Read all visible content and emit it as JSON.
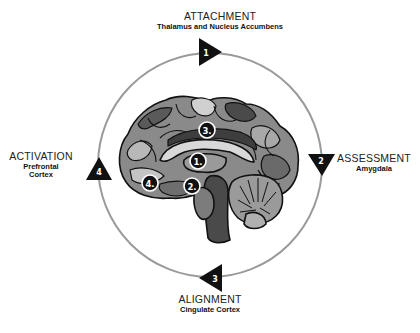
{
  "diagram": {
    "type": "cycle",
    "center_image": "brain-sagittal-illustration",
    "colors": {
      "ring": "#9a9a9a",
      "marker": "#111111",
      "marker_text": "#ffffff",
      "brain_dark": "#3a3a3a",
      "brain_mid": "#7a7a7a",
      "brain_light": "#c8c8c8"
    },
    "stages": [
      {
        "number": "1",
        "title": "ATTACHMENT",
        "region": "Thalamus and Nucleus Accumbens",
        "position": "top",
        "arrow": "right"
      },
      {
        "number": "2",
        "title": "ASSESSMENT",
        "region": "Amygdala",
        "position": "right",
        "arrow": "down"
      },
      {
        "number": "3",
        "title": "ALIGNMENT",
        "region": "Cingulate Cortex",
        "position": "bottom",
        "arrow": "left"
      },
      {
        "number": "4",
        "title": "ACTIVATION",
        "region_line1": "Prefrontal",
        "region_line2": "Cortex",
        "position": "left",
        "arrow": "up"
      }
    ],
    "brain_markers": [
      {
        "label": "1."
      },
      {
        "label": "2."
      },
      {
        "label": "3."
      },
      {
        "label": "4."
      }
    ]
  }
}
